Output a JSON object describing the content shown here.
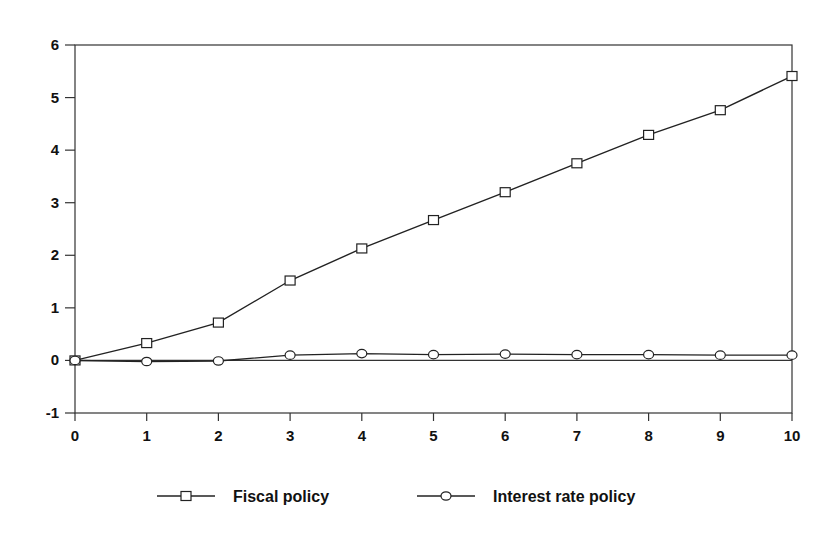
{
  "chart_data": {
    "type": "line",
    "title": "",
    "xlabel": "",
    "ylabel": "",
    "x": [
      0,
      1,
      2,
      3,
      4,
      5,
      6,
      7,
      8,
      9,
      10
    ],
    "xlim": [
      0,
      10
    ],
    "ylim": [
      -1,
      6
    ],
    "xticks": [
      "0",
      "1",
      "2",
      "3",
      "4",
      "5",
      "6",
      "7",
      "8",
      "9",
      "10"
    ],
    "yticks": [
      "-1",
      "0",
      "1",
      "2",
      "3",
      "4",
      "5",
      "6"
    ],
    "grid": false,
    "zero_line": true,
    "legend_position": "bottom",
    "series": [
      {
        "name": "Fiscal policy",
        "marker": "square",
        "values": [
          0.0,
          0.33,
          0.72,
          1.52,
          2.13,
          2.67,
          3.2,
          3.75,
          4.29,
          4.76,
          5.41
        ]
      },
      {
        "name": "Interest rate policy",
        "marker": "circle",
        "values": [
          0.0,
          -0.02,
          -0.01,
          0.1,
          0.13,
          0.11,
          0.12,
          0.11,
          0.11,
          0.1,
          0.1
        ]
      }
    ]
  },
  "legend": {
    "items": [
      {
        "label": "Fiscal policy"
      },
      {
        "label": "Interest rate policy"
      }
    ]
  },
  "colors": {
    "line": "#222222",
    "axis": "#333333"
  }
}
